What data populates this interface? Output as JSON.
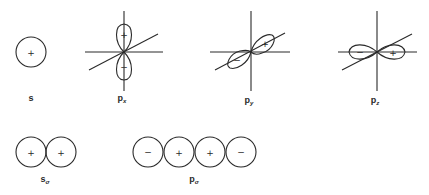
{
  "diagram": {
    "orbitals": [
      {
        "id": "s",
        "label": "s",
        "subscript": "",
        "lobes": [
          {
            "sign": "+"
          }
        ]
      },
      {
        "id": "p1",
        "label": "p",
        "subscript": "x",
        "lobes": [
          {
            "sign": "+"
          },
          {
            "sign": "−"
          }
        ]
      },
      {
        "id": "p2",
        "label": "p",
        "subscript": "y",
        "lobes": [
          {
            "sign": "+"
          },
          {
            "sign": "−"
          }
        ]
      },
      {
        "id": "p3",
        "label": "p",
        "subscript": "z",
        "lobes": [
          {
            "sign": "−"
          },
          {
            "sign": "+"
          }
        ]
      }
    ],
    "overlaps": [
      {
        "id": "s_sigma",
        "label": "s",
        "subscript": "σ",
        "circles": [
          {
            "sign": "+"
          },
          {
            "sign": "+"
          }
        ]
      },
      {
        "id": "p_sigma",
        "label": "p",
        "subscript": "σ",
        "circles": [
          {
            "sign": "−"
          },
          {
            "sign": "+"
          },
          {
            "sign": "+"
          },
          {
            "sign": "−"
          }
        ]
      }
    ]
  },
  "colors": {
    "line": "#2a2a2a",
    "background": "#ffffff"
  }
}
